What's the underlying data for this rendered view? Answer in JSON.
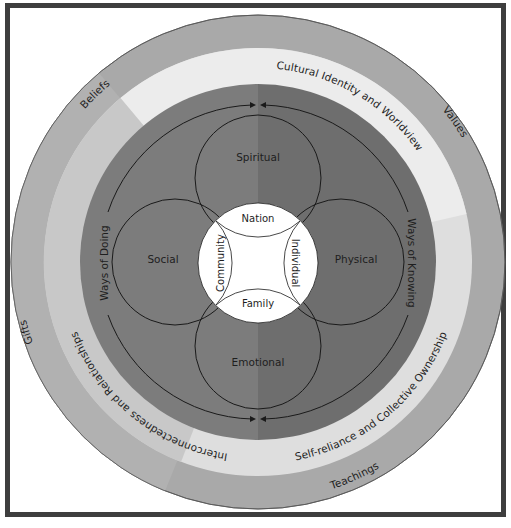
{
  "diagram": {
    "outer_ring": {
      "color": "#a9a9a9",
      "labels": [
        {
          "text": "Beliefs",
          "position": "top-left"
        },
        {
          "text": "Values",
          "position": "right"
        },
        {
          "text": "Teachings",
          "position": "bottom"
        },
        {
          "text": "Gifts",
          "position": "left"
        }
      ]
    },
    "middle_ring": {
      "segments": [
        {
          "text": "Cultural Identity and Worldview",
          "color": "#ececec"
        },
        {
          "text": "Self-reliance and Collective Ownership",
          "color": "#dedede"
        },
        {
          "text": "Interconnectedness and Relationships",
          "color": "#c8c8c8"
        }
      ]
    },
    "inner_disc": {
      "left_color": "#7c7c7c",
      "right_color": "#6e6e6e",
      "arc_labels": [
        {
          "text": "Ways of Doing",
          "side": "left"
        },
        {
          "text": "Ways of Knowing",
          "side": "right"
        }
      ]
    },
    "domains": [
      {
        "text": "Spiritual",
        "position": "top"
      },
      {
        "text": "Social",
        "position": "left"
      },
      {
        "text": "Physical",
        "position": "right"
      },
      {
        "text": "Emotional",
        "position": "bottom"
      }
    ],
    "center": {
      "color": "#ffffff",
      "labels": [
        {
          "text": "Nation",
          "position": "top"
        },
        {
          "text": "Community",
          "position": "left"
        },
        {
          "text": "Individual",
          "position": "right"
        },
        {
          "text": "Family",
          "position": "bottom"
        }
      ]
    },
    "frame_color": "#3e3e3e"
  }
}
